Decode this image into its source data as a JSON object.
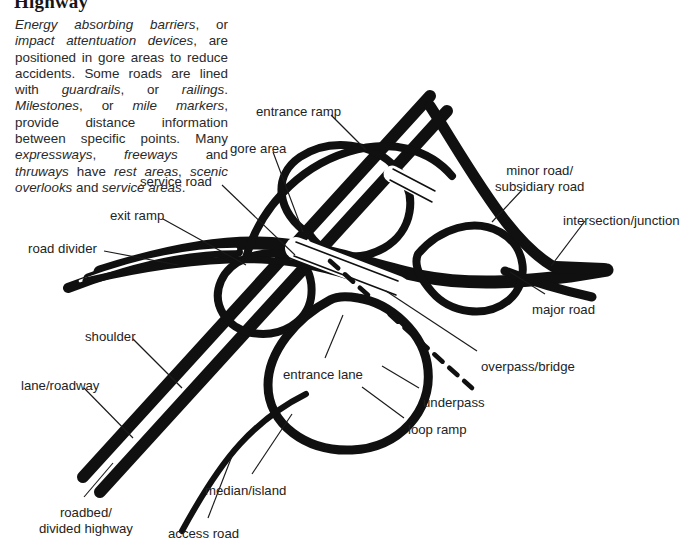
{
  "page": {
    "title": "Highway",
    "background_color": "#ffffff",
    "ink_color": "#101010",
    "text_color": "#232323"
  },
  "intro": {
    "paragraph_html": "<i>Energy absorbing barriers</i><span class=\"rm\">, or </span><i>impact attentuation devices</i><span class=\"rm\">, are positioned in gore areas to reduce accidents. Some roads are lined with </span><i>guardrails</i><span class=\"rm\">, or </span><i>railings</i><span class=\"rm\">. </span><i>Milestones</i><span class=\"rm\">, or </span><i>mile markers</i><span class=\"rm\">, provide distance information between specific points. Many </span><i>expressways</i><span class=\"rm\">, </span><i>freeways</i><span class=\"rm\"> and </span><i>thruways</i><span class=\"rm\"> have </span><i>rest areas</i><span class=\"rm\">, </span><i>scenic overlooks</i><span class=\"rm\"> and </span><i>service areas</i><span class=\"rm\">.</span>",
    "paragraph_text": "Energy absorbing barriers, or impact attentuation devices, are positioned in gore areas to reduce accidents. Some roads are lined with guardrails, or railings. Milestones, or mile markers, provide distance information between specific points. Many expressways, freeways and thruways have rest areas, scenic overlooks and service areas."
  },
  "diagram": {
    "type": "cloverleaf-interchange-schematic",
    "labels": [
      {
        "id": "entrance-ramp",
        "text": "entrance ramp",
        "x": 256,
        "y": 104,
        "align": "left"
      },
      {
        "id": "gore-area",
        "text": "gore area",
        "x": 230,
        "y": 141,
        "align": "left"
      },
      {
        "id": "service-road",
        "text": "service road",
        "x": 140,
        "y": 174,
        "align": "left"
      },
      {
        "id": "exit-ramp",
        "text": "exit ramp",
        "x": 110,
        "y": 208,
        "align": "left"
      },
      {
        "id": "road-divider",
        "text": "road divider",
        "x": 28,
        "y": 241,
        "align": "left"
      },
      {
        "id": "shoulder",
        "text": "shoulder",
        "x": 85,
        "y": 329,
        "align": "left"
      },
      {
        "id": "lane-roadway",
        "text": "lane/roadway",
        "x": 21,
        "y": 378,
        "align": "left"
      },
      {
        "id": "roadbed",
        "text": "roadbed/\ndivided highway",
        "x": 39,
        "y": 505,
        "align": "left"
      },
      {
        "id": "access-road",
        "text": "access road",
        "x": 168,
        "y": 526,
        "align": "left"
      },
      {
        "id": "median-island",
        "text": "median/island",
        "x": 205,
        "y": 483,
        "align": "left"
      },
      {
        "id": "entrance-lane",
        "text": "entrance lane",
        "x": 283,
        "y": 367,
        "align": "left"
      },
      {
        "id": "loop-ramp",
        "text": "loop ramp",
        "x": 408,
        "y": 422,
        "align": "left"
      },
      {
        "id": "underpass",
        "text": "underpass",
        "x": 423,
        "y": 395,
        "align": "left"
      },
      {
        "id": "overpass-bridge",
        "text": "overpass/bridge",
        "x": 481,
        "y": 359,
        "align": "left"
      },
      {
        "id": "major-road",
        "text": "major road",
        "x": 532,
        "y": 302,
        "align": "left"
      },
      {
        "id": "intersection",
        "text": "intersection/junction",
        "x": 563,
        "y": 213,
        "align": "left"
      },
      {
        "id": "minor-road",
        "text": "minor road/\nsubsidiary road",
        "x": 495,
        "y": 163,
        "align": "left"
      }
    ]
  }
}
